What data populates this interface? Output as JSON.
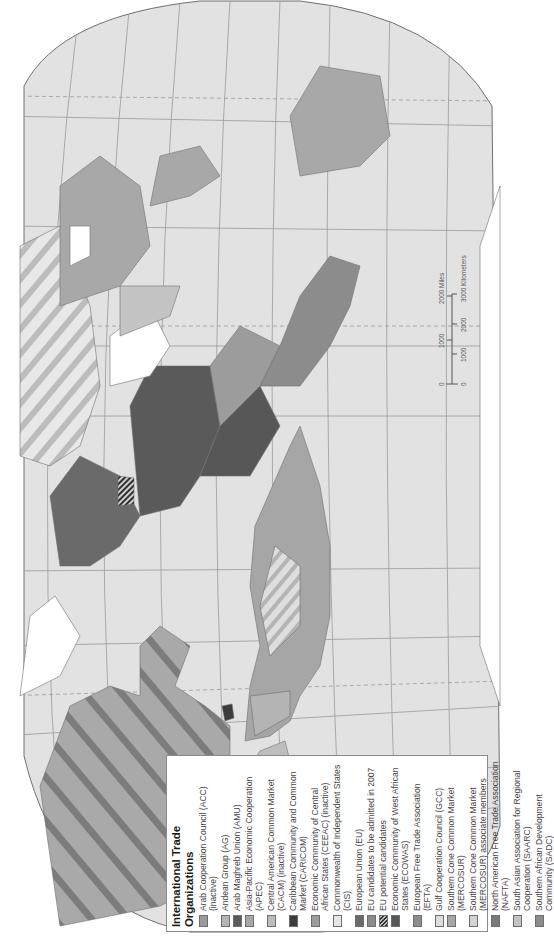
{
  "map": {
    "orientation": "rotated 90 degrees counter-clockwise",
    "projection_style": "oblique world map with graticule",
    "colors": {
      "ocean": "#e2e2e2",
      "land_default": "#d8d8d8",
      "graticule": "#9a9a9a",
      "coast": "#707070"
    }
  },
  "legend": {
    "title": "International Trade Organizations",
    "items": [
      {
        "label": "Arab Cooperation Council (ACC) (inactive)",
        "color": "#9a9a9a",
        "pattern": "solid"
      },
      {
        "label": "Andean Group (AG)",
        "color": "#b4b4b4",
        "pattern": "solid"
      },
      {
        "label": "Arab Maghreb Union (AMU)",
        "color": "#5a5a5a",
        "pattern": "solid"
      },
      {
        "label": "Asia-Pacific Economic Cooperation (APEC)",
        "color": "#a8a8a8",
        "pattern": "solid"
      },
      {
        "label": "Central American Common Market (CACM) (inactive)",
        "color": "#bdbdbd",
        "pattern": "solid"
      },
      {
        "label": "Caribbean Community and Common Market (CARICOM)",
        "color": "#3c3c3c",
        "pattern": "solid"
      },
      {
        "label": "Economic Community of Central African States (CEEAC) (inactive)",
        "color": "#9c9c9c",
        "pattern": "solid"
      },
      {
        "label": "Commonwealth of Independent States (CIS)",
        "color": "#e6e6e6",
        "pattern": "solid"
      },
      {
        "label": "European Union (EU)",
        "color": "#6a6a6a",
        "pattern": "solid"
      },
      {
        "label": "EU candidates to be admitted in 2007",
        "color": "#8a8a8a",
        "pattern": "solid"
      },
      {
        "label": "EU potential candidates",
        "color": "#333333",
        "pattern": "hatch"
      },
      {
        "label": "Economic Community of West African States (ECOWAS)",
        "color": "#575757",
        "pattern": "solid"
      },
      {
        "label": "European Free Trade Association (EFTA)",
        "color": "#8e8e8e",
        "pattern": "solid"
      },
      {
        "label": "Gulf Cooperation Council (GCC)",
        "color": "#dcdcdc",
        "pattern": "solid"
      },
      {
        "label": "Southern Cone Common Market (MERCOSUR)",
        "color": "#a6a6a6",
        "pattern": "solid"
      },
      {
        "label": "Southern Cone Common Market (MERCOSUR) associate members",
        "color": "#d2d2d2",
        "pattern": "solid"
      },
      {
        "label": "North American Free Trade Association (NAFTA)",
        "color": "#7a7a7a",
        "pattern": "solid"
      },
      {
        "label": "South Asian Association for Regional Cooperation (SAARC)",
        "color": "#c4c4c4",
        "pattern": "solid"
      },
      {
        "label": "Southern African Development Community (SADC)",
        "color": "#8c8c8c",
        "pattern": "solid"
      }
    ]
  },
  "scale_bar": {
    "miles_ticks": [
      "0",
      "1000",
      "2000"
    ],
    "miles_unit": "Miles",
    "km_ticks": [
      "0",
      "1000",
      "2000",
      "3000"
    ],
    "km_unit": "Kilometers"
  }
}
